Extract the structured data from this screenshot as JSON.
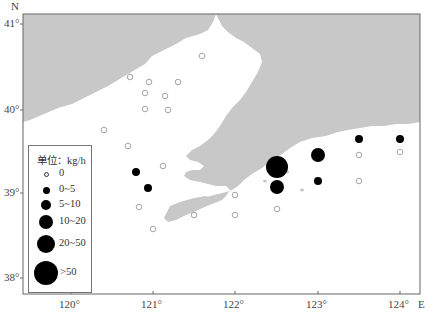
{
  "map": {
    "frame": {
      "left": 23,
      "top": 14,
      "right": 420,
      "bottom": 294
    },
    "colors": {
      "land": "#c8c8c8",
      "sea": "#ffffff",
      "frame": "#666666",
      "filled": "#000000",
      "hollow_stroke": "#9a9a9a"
    },
    "axes": {
      "north_label": "N",
      "east_label": "E",
      "lat_ticks": [
        {
          "label": "41°",
          "y": 24
        },
        {
          "label": "40°",
          "y": 110
        },
        {
          "label": "39°",
          "y": 193
        },
        {
          "label": "38°",
          "y": 278
        }
      ],
      "lon_ticks": [
        {
          "label": "120°",
          "x": 71
        },
        {
          "label": "121°",
          "x": 153
        },
        {
          "label": "122°",
          "x": 235
        },
        {
          "label": "123°",
          "x": 318
        },
        {
          "label": "124°",
          "x": 400
        }
      ]
    },
    "legend": {
      "title": "单位：kg/h",
      "items": [
        {
          "label": "0",
          "r": 2.5,
          "hollow": true
        },
        {
          "label": "0~5",
          "r": 3.5,
          "hollow": false
        },
        {
          "label": "5~10",
          "r": 5,
          "hollow": false
        },
        {
          "label": "10~20",
          "r": 7,
          "hollow": false
        },
        {
          "label": "20~50",
          "r": 9,
          "hollow": false
        },
        {
          "label": ">50",
          "r": 12,
          "hollow": false
        }
      ]
    },
    "stations": [
      {
        "x": 202,
        "y": 56,
        "class": "0"
      },
      {
        "x": 130,
        "y": 77,
        "class": "0"
      },
      {
        "x": 149,
        "y": 82,
        "class": "0"
      },
      {
        "x": 178,
        "y": 82,
        "class": "0"
      },
      {
        "x": 145,
        "y": 93,
        "class": "0"
      },
      {
        "x": 165,
        "y": 96,
        "class": "0"
      },
      {
        "x": 145,
        "y": 109,
        "class": "0"
      },
      {
        "x": 168,
        "y": 110,
        "class": "0"
      },
      {
        "x": 104,
        "y": 130,
        "class": "0"
      },
      {
        "x": 128,
        "y": 146,
        "class": "0"
      },
      {
        "x": 163,
        "y": 166,
        "class": "0"
      },
      {
        "x": 136,
        "y": 172,
        "class": "0~5"
      },
      {
        "x": 148,
        "y": 188,
        "class": "0~5"
      },
      {
        "x": 139,
        "y": 207,
        "class": "0"
      },
      {
        "x": 153,
        "y": 229,
        "class": "0"
      },
      {
        "x": 194,
        "y": 215,
        "class": "0"
      },
      {
        "x": 235,
        "y": 195,
        "class": "0"
      },
      {
        "x": 235,
        "y": 215,
        "class": "0"
      },
      {
        "x": 277,
        "y": 167,
        "class": "20~50"
      },
      {
        "x": 277,
        "y": 187,
        "class": "5~10"
      },
      {
        "x": 277,
        "y": 209,
        "class": "0"
      },
      {
        "x": 318,
        "y": 155,
        "class": "5~10"
      },
      {
        "x": 318,
        "y": 181,
        "class": "0~5"
      },
      {
        "x": 359,
        "y": 139,
        "class": "0~5"
      },
      {
        "x": 359,
        "y": 155,
        "class": "0"
      },
      {
        "x": 359,
        "y": 181,
        "class": "0"
      },
      {
        "x": 400,
        "y": 139,
        "class": "0~5"
      },
      {
        "x": 400,
        "y": 152,
        "class": "0"
      }
    ]
  }
}
